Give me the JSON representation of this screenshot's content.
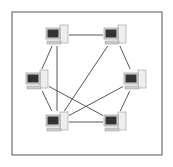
{
  "diagram": {
    "title": "",
    "type": "mesh-network",
    "frame": {
      "x": 12,
      "y": 12,
      "w": 150,
      "h": 143,
      "stroke": "#555555"
    },
    "nodes": [
      {
        "id": "pc-top-left",
        "x": 57,
        "y": 35
      },
      {
        "id": "pc-top-right",
        "x": 115,
        "y": 35
      },
      {
        "id": "pc-mid-left",
        "x": 37,
        "y": 80
      },
      {
        "id": "pc-mid-right",
        "x": 135,
        "y": 80
      },
      {
        "id": "pc-bottom-left",
        "x": 57,
        "y": 122
      },
      {
        "id": "pc-bottom-right",
        "x": 115,
        "y": 122
      }
    ],
    "edges": [
      [
        "pc-top-left",
        "pc-top-right"
      ],
      [
        "pc-top-left",
        "pc-mid-left"
      ],
      [
        "pc-top-left",
        "pc-bottom-left"
      ],
      [
        "pc-top-right",
        "pc-mid-right"
      ],
      [
        "pc-top-right",
        "pc-bottom-left"
      ],
      [
        "pc-mid-left",
        "pc-bottom-left"
      ],
      [
        "pc-mid-left",
        "pc-bottom-right"
      ],
      [
        "pc-mid-right",
        "pc-bottom-left"
      ],
      [
        "pc-mid-right",
        "pc-bottom-right"
      ],
      [
        "pc-bottom-left",
        "pc-bottom-right"
      ]
    ]
  }
}
